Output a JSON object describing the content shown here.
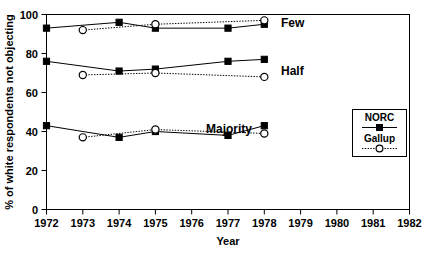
{
  "chart_data": {
    "type": "line",
    "title": "",
    "xlabel": "Year",
    "ylabel": "% of white respondents not objecting",
    "xlim": [
      1972,
      1982
    ],
    "ylim": [
      0,
      100
    ],
    "xticks": [
      1972,
      1973,
      1974,
      1975,
      1976,
      1977,
      1978,
      1979,
      1980,
      1981,
      1982
    ],
    "yticks": [
      0,
      20,
      40,
      60,
      80,
      100
    ],
    "grid": false,
    "legend_position": "right-inside",
    "legend_entries": [
      "NORC",
      "Gallup"
    ],
    "group_annotations": [
      "Few",
      "Half",
      "Majority"
    ],
    "series": [
      {
        "name": "NORC",
        "group": "Few",
        "marker": "filled-square",
        "linestyle": "solid",
        "x": [
          1972,
          1974,
          1975,
          1977,
          1978
        ],
        "values": [
          93,
          96,
          93,
          93,
          95
        ]
      },
      {
        "name": "Gallup",
        "group": "Few",
        "marker": "open-circle",
        "linestyle": "dotted",
        "x": [
          1973,
          1975,
          1978
        ],
        "values": [
          92,
          95,
          97
        ]
      },
      {
        "name": "NORC",
        "group": "Half",
        "marker": "filled-square",
        "linestyle": "solid",
        "x": [
          1972,
          1974,
          1975,
          1977,
          1978
        ],
        "values": [
          76,
          71,
          72,
          76,
          77
        ]
      },
      {
        "name": "Gallup",
        "group": "Half",
        "marker": "open-circle",
        "linestyle": "dotted",
        "x": [
          1973,
          1975,
          1978
        ],
        "values": [
          69,
          70,
          68
        ]
      },
      {
        "name": "NORC",
        "group": "Majority",
        "marker": "filled-square",
        "linestyle": "solid",
        "x": [
          1972,
          1974,
          1975,
          1977,
          1978
        ],
        "values": [
          43,
          37,
          40,
          38,
          43
        ]
      },
      {
        "name": "Gallup",
        "group": "Majority",
        "marker": "open-circle",
        "linestyle": "dotted",
        "x": [
          1973,
          1975,
          1978
        ],
        "values": [
          37,
          41,
          39
        ]
      }
    ]
  },
  "axes": {
    "y_title": "% of white respondents not objecting",
    "x_title": "Year",
    "y_tick_labels": [
      "100",
      "80",
      "60",
      "40",
      "20",
      "0"
    ],
    "x_tick_labels": [
      "1972",
      "1973",
      "1974",
      "1975",
      "1976",
      "1977",
      "1978",
      "1979",
      "1980",
      "1981",
      "1982"
    ]
  },
  "annotations": {
    "few": "Few",
    "half": "Half",
    "majority": "Majority"
  },
  "legend": {
    "norc_label": "NORC",
    "gallup_label": "Gallup"
  },
  "colors": {
    "foreground": "#000000",
    "background": "#ffffff"
  }
}
